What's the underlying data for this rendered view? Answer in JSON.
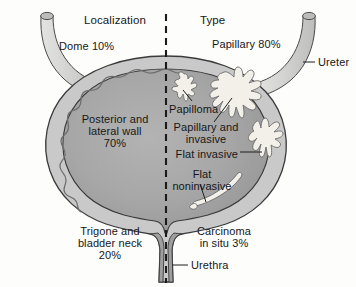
{
  "figure": {
    "background_color": "#fdfdfc",
    "ink_color": "#171717"
  },
  "columns": {
    "left_heading": "Localization",
    "right_heading": "Type"
  },
  "divider": {
    "name": "midline-dashed-divider",
    "color": "#1b1b1b",
    "style": "dashed"
  },
  "localization": {
    "dome": "Dome 10%",
    "posterior_lateral_line1": "Posterior and",
    "posterior_lateral_line2": "lateral wall",
    "posterior_lateral_line3": "70%",
    "trigone_line1": "Trigone and",
    "trigone_line2": "bladder neck",
    "trigone_line3": "20%"
  },
  "types": {
    "papillary": "Papillary 80%",
    "papilloma": "Papilloma",
    "papillary_invasive_line1": "Papillary and",
    "papillary_invasive_line2": "invasive",
    "flat_invasive": "Flat invasive",
    "flat_noninvasive_line1": "Flat",
    "flat_noninvasive_line2": "noninvasive",
    "carcinoma_line1": "Carcinoma",
    "carcinoma_line2": "in situ 3%"
  },
  "anatomy": {
    "ureter": "Ureter",
    "urethra": "Urethra"
  },
  "palette": {
    "bladder_wall": "#c9c9c9",
    "bladder_lumen": "#a8a8a8",
    "lumen_shade": "#9a9a9a",
    "tumor": "#f0eee7",
    "outline": "#3a3a3a",
    "ureter_fill": "#d6d6d4"
  }
}
